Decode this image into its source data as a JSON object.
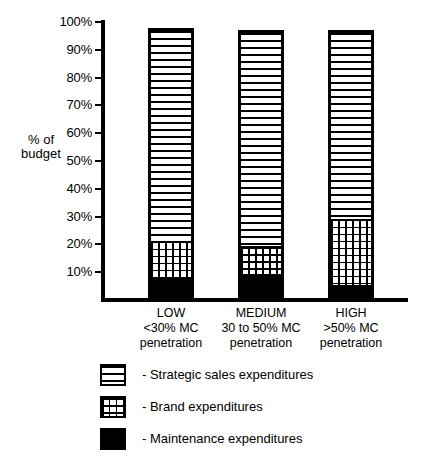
{
  "chart_data": {
    "type": "bar",
    "subtype": "stacked-bar",
    "title": "",
    "xlabel": "",
    "ylabel": "% of budget",
    "ylim": [
      0,
      100
    ],
    "ytick_labels": [
      "100%",
      "90%",
      "80%",
      "70%",
      "60%",
      "50%",
      "40%",
      "30%",
      "20%",
      "10%"
    ],
    "ytick_values": [
      100,
      90,
      80,
      70,
      60,
      50,
      40,
      30,
      20,
      10
    ],
    "grid": false,
    "legend_position": "bottom-left",
    "categories": [
      "LOW",
      "MEDIUM",
      "HIGH"
    ],
    "category_sublabels": [
      [
        "<30% MC",
        "penetration"
      ],
      [
        "30 to 50% MC",
        "penetration"
      ],
      [
        ">50% MC",
        "penetration"
      ]
    ],
    "series": [
      {
        "name": "Maintenance expenditures",
        "legend_label": "- Maintenance expenditures",
        "pattern": "solid-black",
        "values": [
          9,
          10,
          6
        ]
      },
      {
        "name": "Brand expenditures",
        "legend_label": "- Brand expenditures",
        "pattern": "dotted",
        "values": [
          13,
          10,
          24
        ]
      },
      {
        "name": "Strategic sales expenditures",
        "legend_label": "- Strategic sales expenditures",
        "pattern": "horizontal-lines",
        "values": [
          76,
          77,
          67
        ]
      }
    ],
    "totals": [
      98,
      97,
      97
    ],
    "segment_boundaries": {
      "LOW": {
        "maintenance_top": 9,
        "brand_top": 22,
        "bar_top": 98
      },
      "MEDIUM": {
        "maintenance_top": 10,
        "brand_top": 20,
        "bar_top": 97
      },
      "HIGH": {
        "maintenance_top": 6,
        "brand_top": 30,
        "bar_top": 97
      }
    }
  },
  "axis": {
    "y_title_line1": "% of",
    "y_title_line2": "budget"
  },
  "colors": {
    "ink": "#000000",
    "paper": "#ffffff"
  }
}
